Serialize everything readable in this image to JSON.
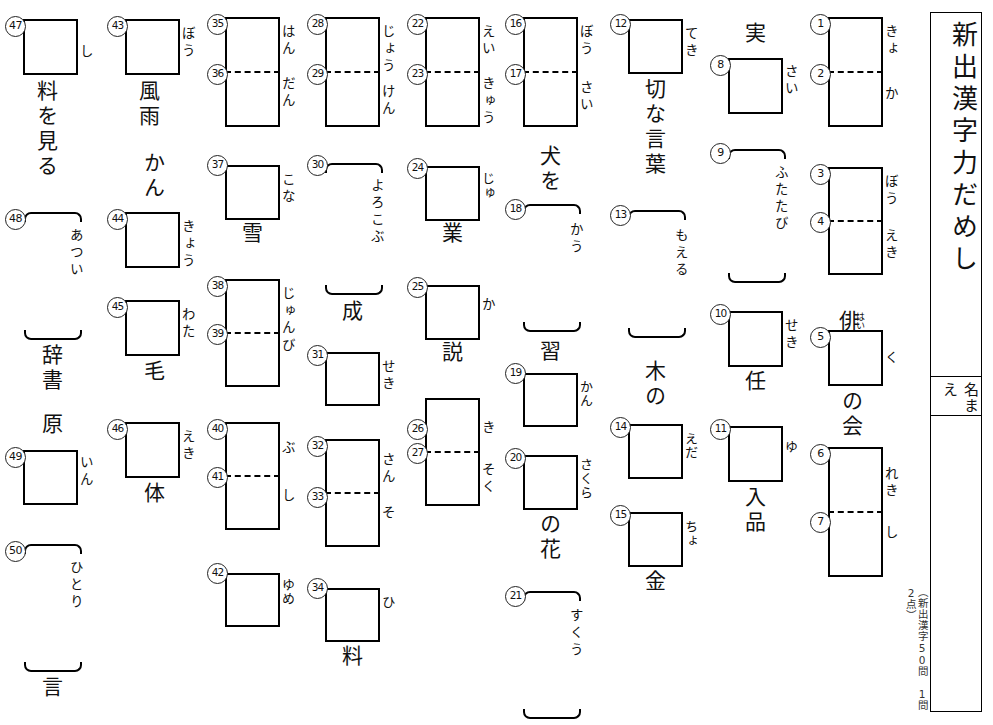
{
  "title": {
    "heading": "新出漢字力だめし",
    "name_label": "名まえ",
    "footnote": "（新出漢字50問　1問2点）"
  },
  "worksheet": {
    "type": "kanji-fill-in-worksheet",
    "total_questions": 50,
    "columns": [
      {
        "id": "col-1",
        "items": [
          {
            "num": "47",
            "kind": "box",
            "reading": "し",
            "context_below": "料を見る"
          },
          {
            "num": "48",
            "kind": "bracket",
            "reading": "あつい",
            "context_below": "辞書"
          },
          {
            "num": "49",
            "kind": "box",
            "reading": "いん",
            "context_above": "原"
          },
          {
            "num": "50",
            "kind": "bracket",
            "reading": "ひとり",
            "context_below": "言"
          }
        ]
      },
      {
        "id": "col-2",
        "items": [
          {
            "num": "43",
            "kind": "box",
            "reading": "ぼう",
            "context_below": "風雨"
          },
          {
            "num": "44",
            "kind": "box",
            "reading": "きょう",
            "context_above": "かん"
          },
          {
            "num": "45",
            "kind": "box",
            "reading": "わた",
            "context_below": "毛"
          },
          {
            "num": "46",
            "kind": "box",
            "reading": "えき",
            "context_below": "体"
          }
        ]
      },
      {
        "id": "col-3",
        "items": [
          {
            "num": "35",
            "num2": "36",
            "kind": "box-split",
            "reading": "はん",
            "reading2": "だん"
          },
          {
            "num": "37",
            "kind": "box",
            "reading": "こな",
            "context_below": "雪"
          },
          {
            "num": "38",
            "num2": "39",
            "kind": "box-split",
            "reading": "じゅん",
            "reading2": "び"
          },
          {
            "num": "40",
            "num2": "41",
            "kind": "box-split",
            "reading": "ぶ",
            "reading2": "し"
          },
          {
            "num": "42",
            "kind": "box",
            "reading": "ゆめ"
          }
        ]
      },
      {
        "id": "col-4",
        "items": [
          {
            "num": "28",
            "num2": "29",
            "kind": "box-split",
            "reading": "じょう",
            "reading2": "けん"
          },
          {
            "num": "30",
            "kind": "bracket",
            "reading": "よろこぶ",
            "context_below": "成"
          },
          {
            "num": "31",
            "kind": "box",
            "reading": "せき"
          },
          {
            "num": "32",
            "num2": "33",
            "kind": "box-split",
            "reading": "さん",
            "reading2": "そ"
          },
          {
            "num": "34",
            "kind": "box",
            "reading": "ひ",
            "context_below": "料"
          }
        ]
      },
      {
        "id": "col-5",
        "items": [
          {
            "num": "22",
            "num2": "23",
            "kind": "box-split",
            "reading": "えい",
            "reading2": "きゅう"
          },
          {
            "num": "24",
            "kind": "box",
            "reading": "じゅ",
            "context_below": "業"
          },
          {
            "num": "25",
            "kind": "box",
            "reading": "か",
            "context_below": "説"
          },
          {
            "num": "26",
            "num2": "27",
            "kind": "box-split",
            "reading": "き",
            "reading2": "そく"
          }
        ]
      },
      {
        "id": "col-6",
        "items": [
          {
            "num": "16",
            "num2": "17",
            "kind": "box-split",
            "reading": "ぼう",
            "reading2": "さい"
          },
          {
            "num": "18",
            "kind": "bracket",
            "reading": "かう",
            "context_above": "犬を",
            "context_below": "習"
          },
          {
            "num": "19",
            "kind": "box",
            "reading": "かん"
          },
          {
            "num": "20",
            "kind": "box",
            "reading": "さくら",
            "context_below": "の花"
          },
          {
            "num": "21",
            "kind": "bracket",
            "reading": "すくう"
          }
        ]
      },
      {
        "id": "col-7",
        "items": [
          {
            "num": "12",
            "kind": "box",
            "reading": "てき",
            "context_below": "切な言葉"
          },
          {
            "num": "13",
            "kind": "bracket",
            "reading": "もえる",
            "context_below": "木の"
          },
          {
            "num": "14",
            "kind": "box",
            "reading": "えだ"
          },
          {
            "num": "15",
            "kind": "box",
            "reading": "ちょ",
            "context_below": "金"
          }
        ]
      },
      {
        "id": "col-8",
        "items": [
          {
            "num": "8",
            "kind": "box",
            "reading": "さい",
            "context_above": "実"
          },
          {
            "num": "9",
            "kind": "bracket",
            "reading": "ふたたび"
          },
          {
            "num": "10",
            "kind": "box",
            "reading": "せき",
            "context_below": "任"
          },
          {
            "num": "11",
            "kind": "box",
            "reading": "ゆ",
            "context_below": "入品"
          }
        ]
      },
      {
        "id": "col-9",
        "items": [
          {
            "num": "1",
            "num2": "2",
            "kind": "box-split",
            "reading": "きょ",
            "reading2": "か"
          },
          {
            "num": "3",
            "num2": "4",
            "kind": "box-split",
            "reading": "ぼう",
            "reading2": "えき"
          },
          {
            "num": "5",
            "kind": "box",
            "reading": "く",
            "context_above": "俳",
            "context_above_ruby": "はい",
            "context_below": "の会"
          },
          {
            "num": "6",
            "num2": "7",
            "kind": "box-split",
            "reading": "れき",
            "reading2": "し"
          }
        ]
      }
    ]
  },
  "labels": {
    "c1_47_reading": "し",
    "c1_47_ctx": "料を見る",
    "c1_48_reading": "あつい",
    "c1_48_ctx": "辞書",
    "c1_49_ctx": "原",
    "c1_49_reading": "いん",
    "c1_50_reading": "ひとり",
    "c1_50_ctx": "言",
    "c2_43_reading": "ぼう",
    "c2_43_ctx": "風雨",
    "c2_44_ctx": "かん",
    "c2_44_reading": "きょう",
    "c2_45_reading": "わた",
    "c2_45_ctx": "毛",
    "c2_46_reading": "えき",
    "c2_46_ctx": "体",
    "c3_35_reading": "はん",
    "c3_36_reading": "だん",
    "c3_37_reading": "こな",
    "c3_37_ctx": "雪",
    "c3_38_reading": "じゅん",
    "c3_39_reading": "び",
    "c3_40_reading": "ぶ",
    "c3_41_reading": "し",
    "c3_42_reading": "ゆめ",
    "c4_28_reading": "じょう",
    "c4_29_reading": "けん",
    "c4_30_reading": "よろこぶ",
    "c4_30_ctx": "成",
    "c4_31_reading": "せき",
    "c4_32_reading": "さん",
    "c4_33_reading": "そ",
    "c4_34_reading": "ひ",
    "c4_34_ctx": "料",
    "c5_22_reading": "えい",
    "c5_23_reading": "きゅう",
    "c5_24_reading": "じゅ",
    "c5_24_ctx": "業",
    "c5_25_reading": "か",
    "c5_25_ctx": "説",
    "c5_26_reading": "き",
    "c5_27_reading": "そく",
    "c6_16_reading": "ぼう",
    "c6_17_reading": "さい",
    "c6_18_ctx_above": "犬を",
    "c6_18_reading": "かう",
    "c6_18_ctx_below": "習",
    "c6_19_reading": "かん",
    "c6_20_reading": "さくら",
    "c6_20_ctx": "の花",
    "c6_21_reading": "すくう",
    "c7_12_reading": "てき",
    "c7_12_ctx": "切な言葉",
    "c7_13_reading": "もえる",
    "c7_13_ctx": "木の",
    "c7_14_reading": "えだ",
    "c7_15_reading": "ちょ",
    "c7_15_ctx": "金",
    "c8_8_ctx": "実",
    "c8_8_reading": "さい",
    "c8_9_reading": "ふたたび",
    "c8_10_reading": "せき",
    "c8_10_ctx": "任",
    "c8_11_reading": "ゆ",
    "c8_11_ctx": "入品",
    "c9_1_reading": "きょ",
    "c9_2_reading": "か",
    "c9_3_reading": "ぼう",
    "c9_4_reading": "えき",
    "c9_5_ctx_above": "俳",
    "c9_5_ruby": "はい",
    "c9_5_reading": "く",
    "c9_5_ctx_below": "の会",
    "c9_6_reading": "れき",
    "c9_7_reading": "し",
    "n1": "1",
    "n2": "2",
    "n3": "3",
    "n4": "4",
    "n5": "5",
    "n6": "6",
    "n7": "7",
    "n8": "8",
    "n9": "9",
    "n10": "10",
    "n11": "11",
    "n12": "12",
    "n13": "13",
    "n14": "14",
    "n15": "15",
    "n16": "16",
    "n17": "17",
    "n18": "18",
    "n19": "19",
    "n20": "20",
    "n21": "21",
    "n22": "22",
    "n23": "23",
    "n24": "24",
    "n25": "25",
    "n26": "26",
    "n27": "27",
    "n28": "28",
    "n29": "29",
    "n30": "30",
    "n31": "31",
    "n32": "32",
    "n33": "33",
    "n34": "34",
    "n35": "35",
    "n36": "36",
    "n37": "37",
    "n38": "38",
    "n39": "39",
    "n40": "40",
    "n41": "41",
    "n42": "42",
    "n43": "43",
    "n44": "44",
    "n45": "45",
    "n46": "46",
    "n47": "47",
    "n48": "48",
    "n49": "49",
    "n50": "50"
  }
}
